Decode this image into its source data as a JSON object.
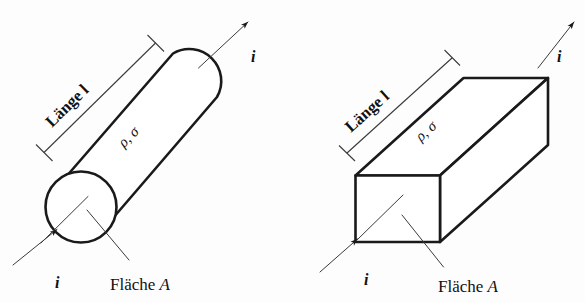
{
  "figure": {
    "background_color": "#fdfdfd",
    "line_color": "#1a1a1a",
    "thin_line_color": "#3a3a3a"
  },
  "diagrams": [
    {
      "id": "cylinder",
      "shape": "cylinder",
      "length_label": "Länge l",
      "material_label": "ρ, σ",
      "area_label_prefix": "Fläche ",
      "area_label_symbol": "A",
      "current_in_label": "i",
      "current_out_label": "i"
    },
    {
      "id": "cuboid",
      "shape": "rectangular-prism",
      "length_label": "Länge l",
      "material_label": "ρ, σ",
      "area_label_prefix": "Fläche ",
      "area_label_symbol": "A",
      "current_in_label": "i",
      "current_out_label": "i"
    }
  ]
}
